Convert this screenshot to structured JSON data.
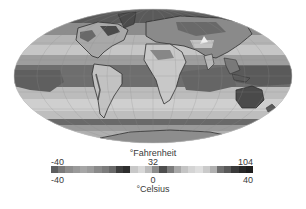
{
  "map": {
    "projection": "mollweide",
    "description": "Global surface temperature map, grayscale",
    "ellipse": {
      "cx": 153,
      "cy": 76,
      "rx": 139,
      "ry": 67
    }
  },
  "legend": {
    "fahrenheit_unit": "°Fahrenheit",
    "celsius_unit": "°Celsius",
    "fahrenheit_ticks": [
      {
        "value": "-40",
        "pos": 0.0
      },
      {
        "value": "32",
        "pos": 0.5
      },
      {
        "value": "104",
        "pos": 1.0
      }
    ],
    "celsius_ticks": [
      {
        "value": "-40",
        "pos": 0.0
      },
      {
        "value": "0",
        "pos": 0.5
      },
      {
        "value": "40",
        "pos": 1.0
      }
    ],
    "colorbar_steps": [
      "#5e5e5e",
      "#7a7a7a",
      "#8e8e8e",
      "#9a9a9a",
      "#a6a6a6",
      "#9c9c9c",
      "#8a8a8a",
      "#7c7c7c",
      "#6a6a6a",
      "#3e3e3e",
      "#2e2e2e",
      "#c8c8c8",
      "#d8d8d8",
      "#bcbcbc",
      "#8c8c8c",
      "#4e4e4e",
      "#7c7c7c",
      "#a8a8a8",
      "#c4c4c4",
      "#d4d4d4",
      "#dedede",
      "#cacaca",
      "#b0b0b0",
      "#707070",
      "#5a5a5a",
      "#3a3a3a",
      "#282828",
      "#1e1e1e"
    ]
  }
}
